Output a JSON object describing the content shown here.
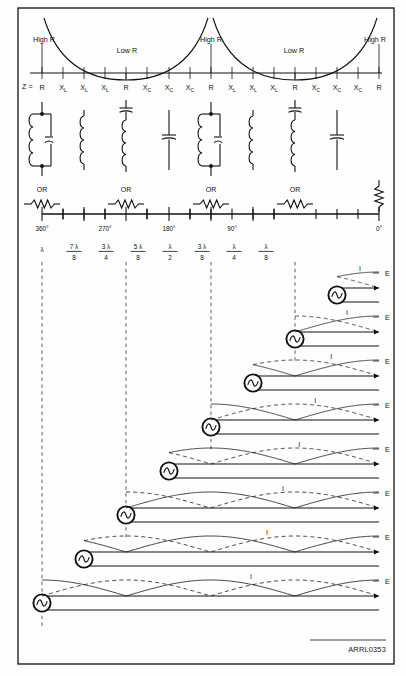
{
  "figure": {
    "id_label": "ARRL0353",
    "width": 406,
    "height": 676,
    "accent": "#111111",
    "grid_color": "#5c5c5c"
  },
  "impedance_curve": {
    "region_labels": [
      {
        "text": "High R",
        "x": 44,
        "y": 44
      },
      {
        "text": "Low R",
        "x": 127,
        "y": 51
      },
      {
        "text": "High R",
        "x": 211,
        "y": 44
      },
      {
        "text": "Low R",
        "x": 294,
        "y": 51
      },
      {
        "text": "High R",
        "x": 376,
        "y": 44
      }
    ]
  },
  "impedance_scale": {
    "prefix": "Z =",
    "ticks": [
      {
        "label": "R",
        "sub": "",
        "x": 42
      },
      {
        "label": "X",
        "sub": "L",
        "x": 63
      },
      {
        "label": "X",
        "sub": "L",
        "x": 84
      },
      {
        "label": "X",
        "sub": "L",
        "x": 105
      },
      {
        "label": "R",
        "sub": "",
        "x": 126
      },
      {
        "label": "X",
        "sub": "C",
        "x": 147
      },
      {
        "label": "X",
        "sub": "C",
        "x": 169
      },
      {
        "label": "X",
        "sub": "C",
        "x": 190
      },
      {
        "label": "R",
        "sub": "",
        "x": 211
      },
      {
        "label": "X",
        "sub": "L",
        "x": 232
      },
      {
        "label": "X",
        "sub": "L",
        "x": 253
      },
      {
        "label": "X",
        "sub": "L",
        "x": 274
      },
      {
        "label": "R",
        "sub": "",
        "x": 295
      },
      {
        "label": "X",
        "sub": "C",
        "x": 316
      },
      {
        "label": "X",
        "sub": "C",
        "x": 337
      },
      {
        "label": "X",
        "sub": "C",
        "x": 358
      },
      {
        "label": "R",
        "sub": "",
        "x": 379
      }
    ]
  },
  "equivalent_circuits": [
    {
      "name": "parallel-lc-tank",
      "x": 42,
      "type": "parallel_lc"
    },
    {
      "name": "inductor",
      "x": 84,
      "type": "inductor"
    },
    {
      "name": "series-lc",
      "x": 126,
      "type": "series_lc"
    },
    {
      "name": "capacitor",
      "x": 169,
      "type": "capacitor"
    },
    {
      "name": "parallel-lc-tank",
      "x": 211,
      "type": "parallel_lc"
    },
    {
      "name": "inductor",
      "x": 253,
      "type": "inductor"
    },
    {
      "name": "series-lc",
      "x": 295,
      "type": "series_lc"
    },
    {
      "name": "capacitor",
      "x": 337,
      "type": "capacitor"
    },
    {
      "name": "resistor-vertical",
      "x": 379,
      "type": "resistor_v"
    }
  ],
  "or_resistors": [
    {
      "label": "OR",
      "x": 42
    },
    {
      "label": "OR",
      "x": 126
    },
    {
      "label": "OR",
      "x": 211
    },
    {
      "label": "OR",
      "x": 295
    }
  ],
  "degree_scale": {
    "baseline_y": 214,
    "ticks": [
      {
        "x": 42,
        "degrees": "360°",
        "num": "",
        "lam": "λ",
        "den": "",
        "major": true
      },
      {
        "x": 63,
        "degrees": "",
        "num": "7",
        "lam": "λ",
        "den": "8",
        "major": false
      },
      {
        "x": 84,
        "degrees": "",
        "num": "",
        "lam": "",
        "den": "",
        "major": true
      },
      {
        "x": 105,
        "degrees": "270°",
        "num": "3",
        "lam": "λ",
        "den": "4",
        "major": false
      },
      {
        "x": 126,
        "degrees": "",
        "num": "",
        "lam": "",
        "den": "",
        "major": true
      },
      {
        "x": 147,
        "degrees": "",
        "num": "5",
        "lam": "λ",
        "den": "8",
        "major": false
      },
      {
        "x": 169,
        "degrees": "180°",
        "num": "",
        "lam": "λ",
        "den": "2",
        "major": true
      },
      {
        "x": 190,
        "degrees": "",
        "num": "3",
        "lam": "λ",
        "den": "8",
        "major": false
      },
      {
        "x": 211,
        "degrees": "",
        "num": "",
        "lam": "",
        "den": "",
        "major": true
      },
      {
        "x": 232,
        "degrees": "90°",
        "num": "",
        "lam": "λ",
        "den": "4",
        "major": false
      },
      {
        "x": 253,
        "degrees": "",
        "num": "",
        "lam": "",
        "den": "",
        "major": true
      },
      {
        "x": 274,
        "degrees": "",
        "num": "",
        "lam": "λ",
        "den": "8",
        "major": false
      },
      {
        "x": 379,
        "degrees": "0°",
        "num": "",
        "lam": "",
        "den": "",
        "major": true
      }
    ],
    "degree_text": [
      "360°",
      "270°",
      "180°",
      "90°",
      "0°"
    ],
    "degree_x": [
      42,
      105,
      169,
      232,
      379
    ],
    "fractions": [
      {
        "x": 42,
        "num": "",
        "lam": "λ",
        "den": ""
      },
      {
        "x": 74,
        "num": "7",
        "lam": "λ",
        "den": "8"
      },
      {
        "x": 106,
        "num": "3",
        "lam": "λ",
        "den": "4"
      },
      {
        "x": 138,
        "num": "5",
        "lam": "λ",
        "den": "8"
      },
      {
        "x": 170,
        "num": "",
        "lam": "λ",
        "den": "2"
      },
      {
        "x": 202,
        "num": "3",
        "lam": "λ",
        "den": "8"
      },
      {
        "x": 234,
        "num": "",
        "lam": "λ",
        "den": "4"
      },
      {
        "x": 266,
        "num": "",
        "lam": "λ",
        "den": "8"
      }
    ]
  },
  "guide_lines": [
    {
      "name": "guide-360",
      "x": 42
    },
    {
      "name": "guide-270",
      "x": 126
    },
    {
      "name": "guide-180",
      "x": 211
    },
    {
      "name": "guide-90",
      "x": 295
    }
  ],
  "wave_rows": [
    {
      "index": 0,
      "source_x": 337,
      "left_x": 330,
      "label_E": "E",
      "label_I": "I",
      "top_y": 288,
      "length_label": "λ/8"
    },
    {
      "index": 1,
      "source_x": 295,
      "left_x": 288,
      "label_E": "E",
      "label_I": "I",
      "top_y": 332,
      "length_label": "λ/4"
    },
    {
      "index": 2,
      "source_x": 253,
      "left_x": 246,
      "label_E": "E",
      "label_I": "I",
      "top_y": 376,
      "length_label": "3λ/8"
    },
    {
      "index": 3,
      "source_x": 211,
      "left_x": 204,
      "label_E": "E",
      "label_I": "I",
      "top_y": 420,
      "length_label": "λ/2"
    },
    {
      "index": 4,
      "source_x": 169,
      "left_x": 162,
      "label_E": "E",
      "label_I": "I",
      "top_y": 464,
      "length_label": "5λ/8"
    },
    {
      "index": 5,
      "source_x": 126,
      "left_x": 119,
      "label_E": "E",
      "label_I": "I",
      "top_y": 508,
      "length_label": "3λ/4"
    },
    {
      "index": 6,
      "source_x": 84,
      "left_x": 77,
      "label_E": "E",
      "label_I": "I",
      "top_y": 552,
      "length_label": "7λ/8"
    },
    {
      "index": 7,
      "source_x": 42,
      "left_x": 35,
      "label_E": "E",
      "label_I": "I",
      "top_y": 596,
      "length_label": "λ"
    }
  ],
  "wave_geometry": {
    "right_end_x": 379,
    "line_gap": 14,
    "wave_amplitude": 16,
    "row_pitch": 44
  }
}
